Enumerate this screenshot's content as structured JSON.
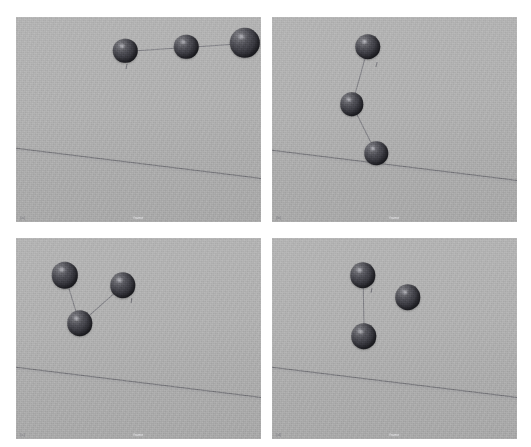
{
  "figure": {
    "title": "",
    "layout": "2x2 grid of rendered 3D scenes",
    "background_color": "#ffffff",
    "panel_background_color": "#b0b0b0",
    "sphere_color": "#3a3a41",
    "line_color": "#565660",
    "rows": 2,
    "cols": 2
  },
  "panels": [
    {
      "id": "panel-top-left",
      "tag": "(a)",
      "caption": "frame",
      "rect": {
        "x": 16,
        "y": 17,
        "w": 245,
        "h": 205
      },
      "horizon": {
        "y_left": 63,
        "angle_deg": 7.0
      },
      "spheres": [
        {
          "cx": 44.5,
          "cy": 16.5,
          "r": 5.0
        },
        {
          "cx": 69.5,
          "cy": 14.5,
          "r": 5.0
        },
        {
          "cx": 93.5,
          "cy": 12.5,
          "r": 6.2
        }
      ],
      "connections": [
        [
          0,
          1
        ],
        [
          1,
          2
        ]
      ],
      "ticks": [
        {
          "x": 45.0,
          "y": 23.0,
          "rot": 10
        }
      ]
    },
    {
      "id": "panel-top-right",
      "tag": "(b)",
      "caption": "frame",
      "rect": {
        "x": 272,
        "y": 17,
        "w": 245,
        "h": 205
      },
      "horizon": {
        "y_left": 64,
        "angle_deg": 7.0
      },
      "spheres": [
        {
          "cx": 39.0,
          "cy": 14.5,
          "r": 5.2
        },
        {
          "cx": 32.5,
          "cy": 42.5,
          "r": 4.8
        },
        {
          "cx": 42.5,
          "cy": 66.5,
          "r": 4.8
        }
      ],
      "connections": [
        [
          0,
          1
        ],
        [
          1,
          2
        ]
      ],
      "ticks": [
        {
          "x": 42.5,
          "y": 22.0,
          "rot": 14
        }
      ]
    },
    {
      "id": "panel-bottom-left",
      "tag": "(c)",
      "caption": "frame",
      "rect": {
        "x": 16,
        "y": 238,
        "w": 245,
        "h": 201
      },
      "horizon": {
        "y_left": 63,
        "angle_deg": 7.0
      },
      "spheres": [
        {
          "cx": 20.0,
          "cy": 18.5,
          "r": 5.4
        },
        {
          "cx": 43.5,
          "cy": 23.5,
          "r": 5.2
        },
        {
          "cx": 26.0,
          "cy": 42.5,
          "r": 5.2
        }
      ],
      "connections": [
        [
          0,
          2
        ],
        [
          1,
          2
        ]
      ],
      "ticks": [
        {
          "x": 47.0,
          "y": 30.0,
          "rot": 8
        }
      ]
    },
    {
      "id": "panel-bottom-right",
      "tag": "(d)",
      "caption": "frame",
      "rect": {
        "x": 272,
        "y": 238,
        "w": 245,
        "h": 201
      },
      "horizon": {
        "y_left": 63,
        "angle_deg": 7.0
      },
      "spheres": [
        {
          "cx": 37.0,
          "cy": 18.5,
          "r": 5.2
        },
        {
          "cx": 55.5,
          "cy": 29.5,
          "r": 5.2
        },
        {
          "cx": 37.5,
          "cy": 49.0,
          "r": 5.2
        }
      ],
      "connections": [
        [
          0,
          2
        ]
      ],
      "ticks": [
        {
          "x": 40.5,
          "y": 25.0,
          "rot": 12
        }
      ]
    }
  ]
}
